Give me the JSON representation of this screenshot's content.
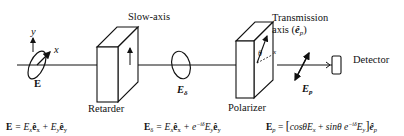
{
  "diagram": {
    "labels": {
      "slow_axis": "Slow-axis",
      "transmission_line1": "Transmission",
      "transmission_line2": "axis (",
      "transmission_sym": "ê",
      "transmission_sub": "p",
      "transmission_close": ")",
      "detector": "Detector",
      "retarder": "Retarder",
      "polarizer": "Polarizer",
      "axis_x": "x",
      "axis_y": "y",
      "field_in": "E",
      "field_delta": "E",
      "field_delta_sub": "δ",
      "field_p": "E",
      "field_p_sub": "p",
      "theta": "θ",
      "pol_axis_x": "x"
    },
    "equations": {
      "input": {
        "lhs": "E",
        "rhs": " = E",
        "t1_sub": "x",
        "t1_vec": "ê",
        "t1_vsub": "x",
        "plus": " + E",
        "t2_sub": "y",
        "t2_vec": "ê",
        "t2_vsub": "y"
      },
      "retarded": {
        "lhs": "E",
        "lhs_sub": "δ",
        "rhs": " = E",
        "t1_sub": "x",
        "t1_vec": "ê",
        "t1_vsub": "x",
        "plus": " + e",
        "exp": "−iδ",
        "t2": "E",
        "t2_sub": "y",
        "t2_vec": "ê",
        "t2_vsub": "y"
      },
      "output": {
        "lhs": "E",
        "lhs_sub": "p",
        "eq": " = ",
        "bracket_open": "[",
        "cos": "cosθE",
        "cos_sub": "x",
        "plus": " + ",
        "sin": "sinθ e",
        "exp": "−iδ",
        "t2": "E",
        "t2_sub": "y",
        "bracket_close": "]",
        "vec": "ê",
        "vec_sub": "p"
      }
    },
    "colors": {
      "stroke": "#111111",
      "background": "#ffffff"
    }
  }
}
